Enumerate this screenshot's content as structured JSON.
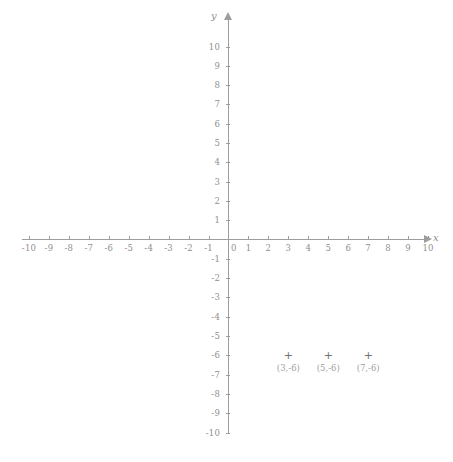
{
  "figure": {
    "background_color": "#ffffff",
    "axis_color": "#9d9d9d",
    "label_color": "#8f8f8f",
    "point_color": "#6f6f6f",
    "point_label_color": "#a2a2a2",
    "x_axis_name": "x",
    "y_axis_name": "y",
    "origin_label": "0",
    "point_marker_glyph": "+"
  },
  "chart_data": {
    "type": "scatter",
    "title": "",
    "xlabel": "x",
    "ylabel": "y",
    "xlim": [
      -10,
      10
    ],
    "ylim": [
      -10,
      10
    ],
    "grid": false,
    "legend": "none",
    "x_ticks": [
      -10,
      -9,
      -8,
      -7,
      -6,
      -5,
      -4,
      -3,
      -2,
      -1,
      0,
      1,
      2,
      3,
      4,
      5,
      6,
      7,
      8,
      9,
      10
    ],
    "y_ticks": [
      -10,
      -9,
      -8,
      -7,
      -6,
      -5,
      -4,
      -3,
      -2,
      -1,
      0,
      1,
      2,
      3,
      4,
      5,
      6,
      7,
      8,
      9,
      10
    ],
    "x_tick_labels": [
      "-10",
      "-9",
      "-8",
      "-7",
      "-6",
      "-5",
      "-4",
      "-3",
      "-2",
      "-1",
      "0",
      "1",
      "2",
      "3",
      "4",
      "5",
      "6",
      "7",
      "8",
      "9",
      "10"
    ],
    "y_tick_labels": [
      "-10",
      "-9",
      "-8",
      "-7",
      "-6",
      "-5",
      "-4",
      "-3",
      "-2",
      "-1",
      "0",
      "1",
      "2",
      "3",
      "4",
      "5",
      "6",
      "7",
      "8",
      "9",
      "10"
    ],
    "points": [
      {
        "x": 3,
        "y": -6,
        "label": "(3,-6)"
      },
      {
        "x": 5,
        "y": -6,
        "label": "(5,-6)"
      },
      {
        "x": 7,
        "y": -6,
        "label": "(7,-6)"
      }
    ]
  }
}
